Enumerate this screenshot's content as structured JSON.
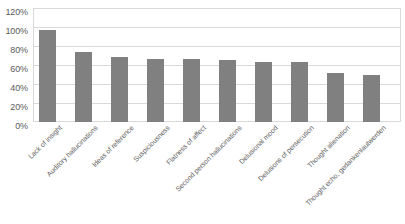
{
  "chart_data": {
    "type": "bar",
    "title": "",
    "subtitle": "",
    "xlabel": "",
    "ylabel": "",
    "ylim": [
      0,
      120
    ],
    "y_tick_labels": [
      "0%",
      "20%",
      "40%",
      "60%",
      "80%",
      "100%",
      "120%"
    ],
    "y_ticks": [
      0,
      20,
      40,
      60,
      80,
      100,
      120
    ],
    "grid": true,
    "legend": false,
    "legend_position": "none",
    "bar_color": "#808080",
    "gridline_color": "#d9d9d9",
    "categories": [
      "Lack of insight",
      "Auditory hallucinations",
      "Ideas of reference",
      "Suspiciousness",
      "Flatness of affect",
      "Second person hallucinations",
      "Delusional mood",
      "Delusions of persecution",
      "Thought alienation",
      "Thought echo, gedankenlautwerden"
    ],
    "values": [
      97,
      74,
      68,
      66,
      66,
      65,
      63,
      63,
      52,
      50
    ],
    "value_labels": [
      "97%",
      "74%",
      "68%",
      "66%",
      "66%",
      "65%",
      "63%",
      "63%",
      "52%",
      "50%"
    ]
  }
}
